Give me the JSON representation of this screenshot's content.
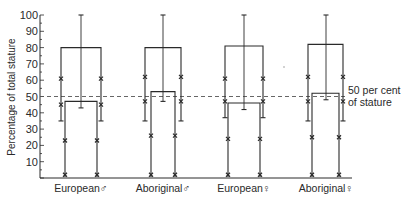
{
  "chart_data": {
    "type": "box-range",
    "title": "",
    "xlabel": "",
    "ylabel": "Percentage of total stature",
    "ylim": [
      0,
      100
    ],
    "yticks": [
      10,
      20,
      30,
      40,
      50,
      60,
      70,
      80,
      90,
      100
    ],
    "grid": false,
    "categories": [
      "European ♂",
      "Aboriginal ♂",
      "European ♀",
      "Aboriginal ♀"
    ],
    "reference_line": {
      "value": 50,
      "style": "dashed",
      "label_line1": "50 per cent",
      "label_line2": "of stature"
    },
    "groups": [
      {
        "name": "European ♂",
        "outer_box_top": 80,
        "outer_leg_bottom": 35,
        "outer_marks": [
          61,
          45
        ],
        "inner_box_top": 47,
        "inner_leg_bottom": 0,
        "inner_marks": [
          23,
          2
        ],
        "center_range": [
          43,
          100
        ]
      },
      {
        "name": "Aboriginal ♂",
        "outer_box_top": 80,
        "outer_leg_bottom": 35,
        "outer_marks": [
          62,
          47
        ],
        "inner_box_top": 53,
        "inner_leg_bottom": 0,
        "inner_marks": [
          26,
          2
        ],
        "center_range": [
          47,
          100
        ]
      },
      {
        "name": "European ♀",
        "outer_box_top": 81,
        "outer_leg_bottom": 37,
        "outer_marks": [
          61,
          47
        ],
        "inner_box_top": 46,
        "inner_leg_bottom": 0,
        "inner_marks": [
          24,
          2
        ],
        "center_range": [
          42,
          100
        ]
      },
      {
        "name": "Aboriginal ♀",
        "outer_box_top": 82,
        "outer_leg_bottom": 35,
        "outer_marks": [
          62,
          47
        ],
        "inner_box_top": 52,
        "inner_leg_bottom": 0,
        "inner_marks": [
          25,
          2
        ],
        "center_range": [
          48,
          100
        ]
      }
    ]
  },
  "axis": {
    "tick_labels": [
      "10",
      "20",
      "30",
      "40",
      "50",
      "60",
      "70",
      "80",
      "90",
      "100"
    ]
  },
  "labels": {
    "ylabel": "Percentage of total stature",
    "ref_line1": "50 per cent",
    "ref_line2": "of stature",
    "cat0": "European♂",
    "cat1": "Aboriginal♂",
    "cat2": "European♀",
    "cat3": "Aboriginal♀"
  }
}
